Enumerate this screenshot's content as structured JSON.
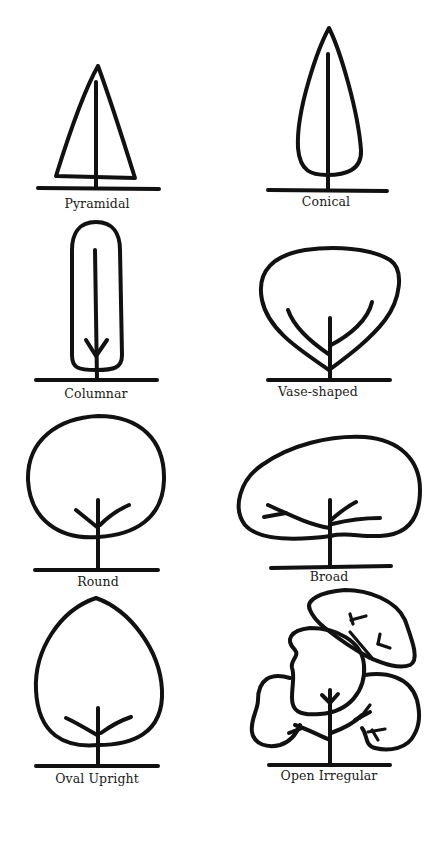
{
  "diagram": {
    "ink_color": "#111111",
    "background": "#ffffff",
    "shapes": [
      {
        "id": "pyramidal",
        "label": "Pyramidal",
        "column": "left",
        "row": 1
      },
      {
        "id": "conical",
        "label": "Conical",
        "column": "right",
        "row": 1
      },
      {
        "id": "columnar",
        "label": "Columnar",
        "column": "left",
        "row": 2
      },
      {
        "id": "vase-shaped",
        "label": "Vase-shaped",
        "column": "right",
        "row": 2
      },
      {
        "id": "round",
        "label": "Round",
        "column": "left",
        "row": 3
      },
      {
        "id": "broad",
        "label": "Broad",
        "column": "right",
        "row": 3
      },
      {
        "id": "oval-upright",
        "label": "Oval Upright",
        "column": "left",
        "row": 4
      },
      {
        "id": "open-irregular",
        "label": "Open Irregular",
        "column": "right",
        "row": 4
      }
    ]
  }
}
